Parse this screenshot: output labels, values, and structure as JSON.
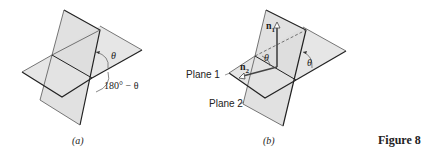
{
  "figure": {
    "caption": "Figure 8",
    "panels": [
      {
        "id": "a",
        "label": "(a)",
        "angle_labels": [
          "θ",
          "180° − θ"
        ]
      },
      {
        "id": "b",
        "label": "(b)",
        "plane_labels": [
          "Plane 1",
          "Plane 2"
        ],
        "normal_labels": [
          {
            "base": "n",
            "sub": "1"
          },
          {
            "base": "n",
            "sub": "2"
          }
        ],
        "angle_labels": [
          "θ",
          "θ"
        ]
      }
    ]
  },
  "colors": {
    "plane_fill": "#e4e4e4",
    "edge": "#222222",
    "thin_line": "#555555"
  }
}
